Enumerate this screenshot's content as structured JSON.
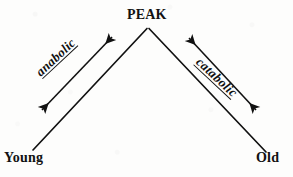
{
  "diagram": {
    "type": "life-cycle-chevron",
    "nodes": {
      "peak": "PEAK",
      "young": "Young",
      "old": "Old"
    },
    "processes": {
      "anabolic": "anabolic",
      "catabolic": "catabolic"
    },
    "colors": {
      "ink": "#111111",
      "paper": "#fdfdfc"
    },
    "geometry": {
      "apex": [
        148,
        28
      ],
      "left_end": [
        33,
        150
      ],
      "right_end": [
        266,
        152
      ]
    }
  }
}
